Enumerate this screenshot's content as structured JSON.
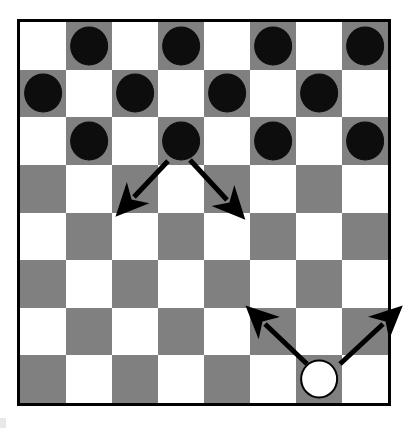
{
  "scene": {
    "title": "Checkers board position",
    "board_size": 8,
    "colors": {
      "light_square": "#ffffff",
      "dark_square": "#808080",
      "black_piece": "#0d0d0d",
      "white_piece": "#ffffff",
      "border": "#000000",
      "arrow": "#000000",
      "background": "#ffffff"
    }
  },
  "chart_data": {
    "type": "table",
    "xlabel": "file (column 0-7, left to right)",
    "ylabel": "rank (row 0-7, top to bottom)",
    "square_pattern": "square (r,c) is dark when (r + c) is odd",
    "rows": [
      [
        "light",
        "dark",
        "light",
        "dark",
        "light",
        "dark",
        "light",
        "dark"
      ],
      [
        "dark",
        "light",
        "dark",
        "light",
        "dark",
        "light",
        "dark",
        "light"
      ],
      [
        "light",
        "dark",
        "light",
        "dark",
        "light",
        "dark",
        "light",
        "dark"
      ],
      [
        "dark",
        "light",
        "dark",
        "light",
        "dark",
        "light",
        "dark",
        "light"
      ],
      [
        "light",
        "dark",
        "light",
        "dark",
        "light",
        "dark",
        "light",
        "dark"
      ],
      [
        "dark",
        "light",
        "dark",
        "light",
        "dark",
        "light",
        "dark",
        "light"
      ],
      [
        "light",
        "dark",
        "light",
        "dark",
        "light",
        "dark",
        "light",
        "dark"
      ],
      [
        "dark",
        "light",
        "dark",
        "light",
        "dark",
        "light",
        "dark",
        "light"
      ]
    ],
    "pieces": [
      {
        "row": 0,
        "col": 1,
        "color": "black"
      },
      {
        "row": 0,
        "col": 3,
        "color": "black"
      },
      {
        "row": 0,
        "col": 5,
        "color": "black"
      },
      {
        "row": 0,
        "col": 7,
        "color": "black"
      },
      {
        "row": 1,
        "col": 0,
        "color": "black"
      },
      {
        "row": 1,
        "col": 2,
        "color": "black"
      },
      {
        "row": 1,
        "col": 4,
        "color": "black"
      },
      {
        "row": 1,
        "col": 6,
        "color": "black"
      },
      {
        "row": 2,
        "col": 1,
        "color": "black"
      },
      {
        "row": 2,
        "col": 3,
        "color": "black"
      },
      {
        "row": 2,
        "col": 5,
        "color": "black"
      },
      {
        "row": 2,
        "col": 7,
        "color": "black"
      },
      {
        "row": 7,
        "col": 6,
        "color": "white"
      }
    ],
    "counts": {
      "black_pieces": 12,
      "white_pieces": 1,
      "empty_squares": 51
    },
    "move_arrows": [
      {
        "label": "black-move-down-left",
        "from_piece": {
          "row": 2,
          "col": 3,
          "color": "black"
        },
        "to_square": {
          "row": 3,
          "col": 2
        },
        "direction": "down-left",
        "x1": 168,
        "y1": 161,
        "x2": 134,
        "y2": 197
      },
      {
        "label": "black-move-down-right",
        "from_piece": {
          "row": 2,
          "col": 3,
          "color": "black"
        },
        "to_square": {
          "row": 3,
          "col": 4
        },
        "direction": "down-right",
        "x1": 190,
        "y1": 160,
        "x2": 227,
        "y2": 200
      },
      {
        "label": "white-move-up-left",
        "from_piece": {
          "row": 7,
          "col": 6,
          "color": "white"
        },
        "to_square": {
          "row": 6,
          "col": 5
        },
        "direction": "up-left",
        "x1": 307,
        "y1": 364,
        "x2": 265,
        "y2": 324
      },
      {
        "label": "white-move-up-right",
        "from_piece": {
          "row": 7,
          "col": 6,
          "color": "white"
        },
        "to_square": {
          "row": 6,
          "col": 7
        },
        "direction": "up-right",
        "x1": 340,
        "y1": 364,
        "x2": 383,
        "y2": 324
      }
    ]
  }
}
